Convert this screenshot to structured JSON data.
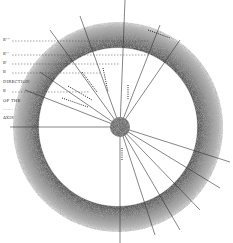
{
  "diagram": {
    "type": "astronomical ring diagram",
    "center": {
      "x": 118,
      "y": 127
    },
    "ring": {
      "outer_radius": 105,
      "inner_radius": 79,
      "color": "#9a9a9a"
    },
    "earth": {
      "x": 120,
      "y": 127,
      "r": 10,
      "color": "#777777"
    },
    "labels": [
      {
        "text": "E'''",
        "x": 3,
        "y": 40
      },
      {
        "text": "E''",
        "x": 3,
        "y": 54
      },
      {
        "text": "E'",
        "x": 3,
        "y": 63
      },
      {
        "text": "E",
        "x": 3,
        "y": 72
      },
      {
        "text": "DIRECTION",
        "x": 3,
        "y": 82
      },
      {
        "text": "E",
        "x": 3,
        "y": 91
      },
      {
        "text": "OF THE",
        "x": 3,
        "y": 101
      },
      {
        "text": "·······",
        "x": 3,
        "y": 110
      },
      {
        "text": "AXIS",
        "x": 3,
        "y": 118
      }
    ]
  }
}
